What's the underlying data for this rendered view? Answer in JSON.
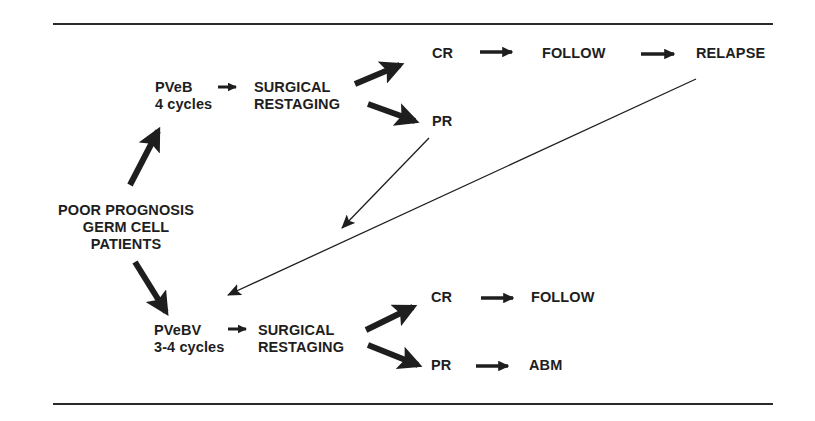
{
  "diagram": {
    "type": "treatment-flowchart",
    "origin": {
      "line1": "POOR PROGNOSIS",
      "line2": "GERM CELL",
      "line3": "PATIENTS"
    },
    "upper_branch": {
      "regimen": "PVeB",
      "cycles": "4 cycles",
      "surgery_line1": "SURGICAL",
      "surgery_line2": "RESTAGING",
      "cr": "CR",
      "follow": "FOLLOW",
      "relapse": "RELAPSE",
      "pr": "PR"
    },
    "lower_branch": {
      "regimen": "PVeBV",
      "cycles": "3-4 cycles",
      "surgery_line1": "SURGICAL",
      "surgery_line2": "RESTAGING",
      "cr": "CR",
      "follow": "FOLLOW",
      "pr": "PR",
      "abm": "ABM"
    },
    "edges": [
      {
        "from": "origin",
        "to": "PVeB"
      },
      {
        "from": "origin",
        "to": "PVeBV"
      },
      {
        "from": "PVeB",
        "to": "SURGICAL RESTAGING (upper)"
      },
      {
        "from": "SURGICAL RESTAGING (upper)",
        "to": "CR (upper)"
      },
      {
        "from": "SURGICAL RESTAGING (upper)",
        "to": "PR (upper)"
      },
      {
        "from": "CR (upper)",
        "to": "FOLLOW (upper)"
      },
      {
        "from": "FOLLOW (upper)",
        "to": "RELAPSE"
      },
      {
        "from": "PR (upper)",
        "to": "PVeBV"
      },
      {
        "from": "RELAPSE",
        "to": "PVeBV"
      },
      {
        "from": "PVeBV",
        "to": "SURGICAL RESTAGING (lower)"
      },
      {
        "from": "SURGICAL RESTAGING (lower)",
        "to": "CR (lower)"
      },
      {
        "from": "SURGICAL RESTAGING (lower)",
        "to": "PR (lower)"
      },
      {
        "from": "CR (lower)",
        "to": "FOLLOW (lower)"
      },
      {
        "from": "PR (lower)",
        "to": "ABM"
      }
    ],
    "colors": {
      "ink": "#1e1e1e",
      "background": "#ffffff"
    }
  }
}
